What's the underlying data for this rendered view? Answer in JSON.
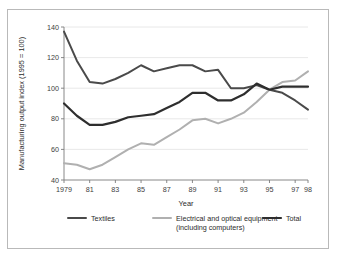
{
  "figure": {
    "cut_title_fragment": "",
    "border_color": "#b9b9b9",
    "background": "#ffffff"
  },
  "chart_data": {
    "type": "line",
    "title": "",
    "xlabel": "Year",
    "ylabel": "Manufacturing output index (1995 = 100)",
    "x": [
      1979,
      1980,
      1981,
      1982,
      1983,
      1984,
      1985,
      1986,
      1987,
      1988,
      1989,
      1990,
      1991,
      1992,
      1993,
      1994,
      1995,
      1996,
      1997,
      1998
    ],
    "xtick_labels": [
      "1979",
      "81",
      "83",
      "85",
      "87",
      "89",
      "91",
      "93",
      "95",
      "97",
      "98"
    ],
    "xtick_values": [
      1979,
      1981,
      1983,
      1985,
      1987,
      1989,
      1991,
      1993,
      1995,
      1997,
      1998
    ],
    "ytick_labels": [
      "40",
      "60",
      "80",
      "100",
      "120",
      "140"
    ],
    "ytick_values": [
      40,
      60,
      80,
      100,
      120,
      140
    ],
    "xlim": [
      1979,
      1998
    ],
    "ylim": [
      40,
      140
    ],
    "grid": "horizontal",
    "legend_position": "bottom",
    "series": [
      {
        "name": "Textiles",
        "color": "#4a4a4a",
        "width": 2.0,
        "values": [
          137,
          118,
          104,
          103,
          106,
          110,
          115,
          111,
          113,
          115,
          115,
          111,
          112,
          100,
          100,
          102,
          99,
          97,
          92,
          86
        ]
      },
      {
        "name": "Electrical and optical equipment (including computers)",
        "color": "#b0b0b0",
        "width": 2.0,
        "values": [
          51,
          50,
          47,
          50,
          55,
          60,
          64,
          63,
          68,
          73,
          79,
          80,
          77,
          80,
          84,
          91,
          99,
          104,
          105,
          111
        ]
      },
      {
        "name": "Total",
        "color": "#2e2e2e",
        "width": 2.2,
        "values": [
          90,
          82,
          76,
          76,
          78,
          81,
          82,
          83,
          87,
          91,
          97,
          97,
          92,
          92,
          96,
          103,
          99,
          101,
          101,
          101
        ]
      }
    ]
  },
  "legend": {
    "entries": [
      {
        "label": "Textiles",
        "color": "#4a4a4a"
      },
      {
        "label": "Electrical and optical equipment",
        "label_line2": "(including computers)",
        "color": "#b0b0b0"
      },
      {
        "label": "Total",
        "color": "#2e2e2e"
      }
    ]
  }
}
